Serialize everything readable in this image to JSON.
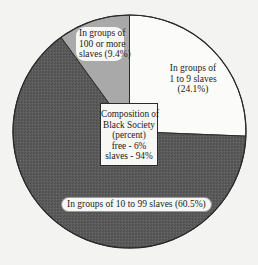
{
  "chart_data": {
    "type": "pie",
    "title": "Composition of Black Society (percent)",
    "categories": [
      "In groups of 1 to 9 slaves",
      "In groups of 10 to 99 slaves",
      "In groups of 100 or more slaves"
    ],
    "values": [
      24.1,
      60.5,
      9.4
    ],
    "colors": [
      "#fbfbf9",
      "#5b5b5b",
      "#a9a9a9"
    ],
    "start_angle": "12 o'clock, clockwise",
    "annotations": [
      {
        "text": "Composition of Black Society (percent) free - 6% slaves - 94%",
        "position": "center box"
      }
    ],
    "composition": {
      "free": 6,
      "slaves": 94
    }
  },
  "labels": {
    "small": {
      "line1": "In groups of",
      "line2": "1 to 9 slaves",
      "line3": "(24.1%)"
    },
    "large": {
      "line1": "In groups of",
      "line2": "100 or more",
      "line3": "slaves (9.4%)"
    },
    "medium": {
      "text": "In groups of 10 to 99 slaves (60.5%)"
    },
    "center": {
      "line1": "Composition of",
      "line2": "Black Society",
      "line3": "(percent)",
      "line4": "free - 6%",
      "line5": "slaves - 94%"
    }
  }
}
